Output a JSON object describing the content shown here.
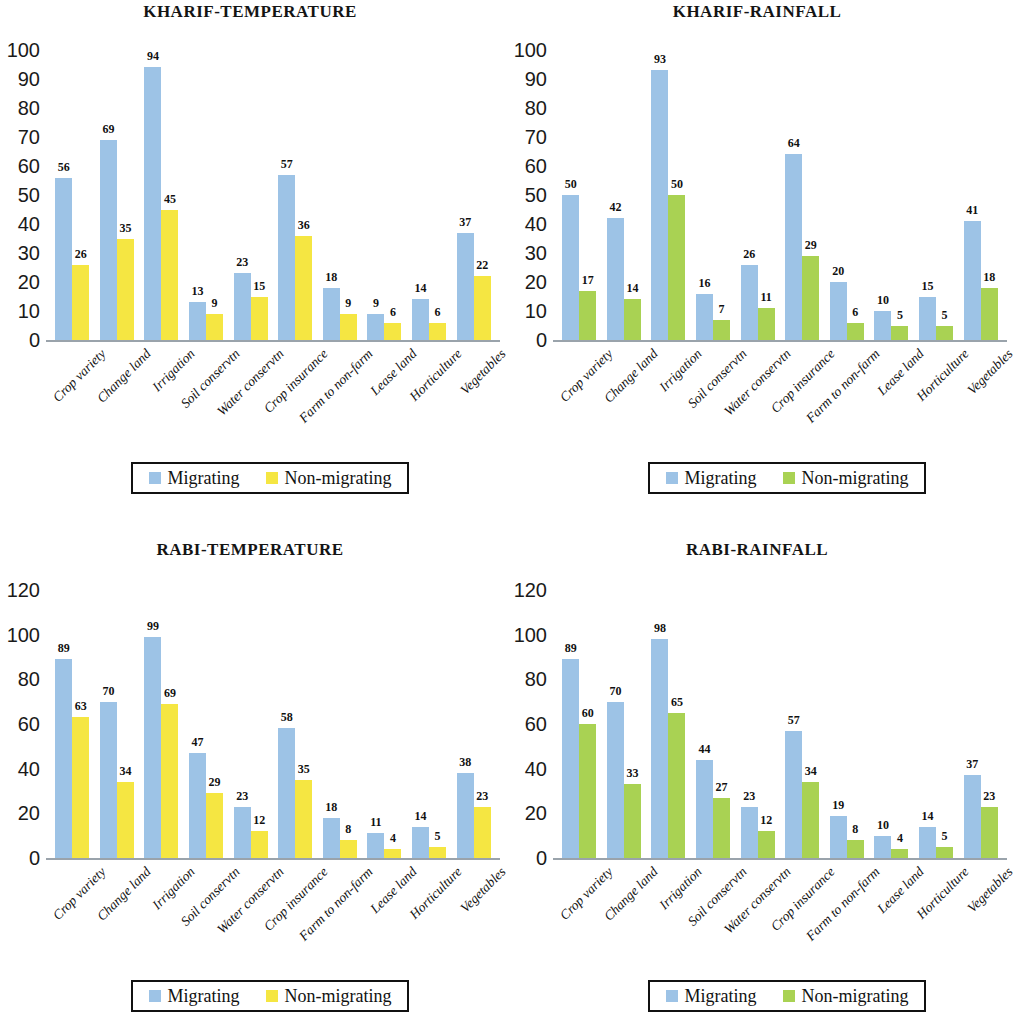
{
  "colors": {
    "migrating": "#9dc3e6",
    "non_migrating_yellow": "#f5e642",
    "non_migrating_green": "#a9d253",
    "axis": "#9aa3ab",
    "text": "#111111"
  },
  "categories": [
    "Crop variety",
    "Change land",
    "Irrigation",
    "Soil conservtn",
    "Water conservtn",
    "Crop insurance",
    "Farm to non-farm",
    "Lease land",
    "Horticulture",
    "Vegetables"
  ],
  "legend": {
    "migrating_label": "Migrating",
    "non_migrating_label": "Non-migrating"
  },
  "chart_data": [
    {
      "id": "kharif-temperature",
      "type": "bar",
      "title": "KHARIF-TEMPERATURE",
      "xlabel": "",
      "ylabel": "",
      "ylim": [
        0,
        100
      ],
      "yticks": [
        0,
        10,
        20,
        30,
        40,
        50,
        60,
        70,
        80,
        90,
        100
      ],
      "ytick_labels": [
        "0",
        "10",
        "20",
        "30",
        "40",
        "50",
        "60",
        "70",
        "80",
        "90",
        "100"
      ],
      "grid": false,
      "legend_position": "bottom-center",
      "categories": [
        "Crop variety",
        "Change land",
        "Irrigation",
        "Soil conservtn",
        "Water conservtn",
        "Crop insurance",
        "Farm to non-farm",
        "Lease land",
        "Horticulture",
        "Vegetables"
      ],
      "series": [
        {
          "name": "Migrating",
          "color": "#9dc3e6",
          "values": [
            56,
            69,
            94,
            13,
            23,
            57,
            18,
            9,
            14,
            37
          ]
        },
        {
          "name": "Non-migrating",
          "color": "#f5e642",
          "values": [
            26,
            35,
            45,
            9,
            15,
            36,
            9,
            6,
            6,
            22
          ]
        }
      ]
    },
    {
      "id": "kharif-rainfall",
      "type": "bar",
      "title": "KHARIF-RAINFALL",
      "xlabel": "",
      "ylabel": "",
      "ylim": [
        0,
        100
      ],
      "yticks": [
        0,
        10,
        20,
        30,
        40,
        50,
        60,
        70,
        80,
        90,
        100
      ],
      "ytick_labels": [
        "0",
        "10",
        "20",
        "30",
        "40",
        "50",
        "60",
        "70",
        "80",
        "90",
        "100"
      ],
      "grid": false,
      "legend_position": "bottom-center",
      "categories": [
        "Crop variety",
        "Change land",
        "Irrigation",
        "Soil conservtn",
        "Water conservtn",
        "Crop insurance",
        "Farm to non-farm",
        "Lease land",
        "Horticulture",
        "Vegetables"
      ],
      "series": [
        {
          "name": "Migrating",
          "color": "#9dc3e6",
          "values": [
            50,
            42,
            93,
            16,
            26,
            64,
            20,
            10,
            15,
            41
          ]
        },
        {
          "name": "Non-migrating",
          "color": "#a9d253",
          "values": [
            17,
            14,
            50,
            7,
            11,
            29,
            6,
            5,
            5,
            18
          ]
        }
      ]
    },
    {
      "id": "rabi-temperature",
      "type": "bar",
      "title": "RABI-TEMPERATURE",
      "xlabel": "",
      "ylabel": "",
      "ylim": [
        0,
        120
      ],
      "yticks": [
        0,
        20,
        40,
        60,
        80,
        100,
        120
      ],
      "ytick_labels": [
        "0",
        "20",
        "40",
        "60",
        "80",
        "100",
        "120"
      ],
      "grid": false,
      "legend_position": "bottom-center",
      "categories": [
        "Crop variety",
        "Change land",
        "Irrigation",
        "Soil conservtn",
        "Water conservtn",
        "Crop insurance",
        "Farm to non-farm",
        "Lease land",
        "Horticulture",
        "Vegetables"
      ],
      "series": [
        {
          "name": "Migrating",
          "color": "#9dc3e6",
          "values": [
            89,
            70,
            99,
            47,
            23,
            58,
            18,
            11,
            14,
            38
          ]
        },
        {
          "name": "Non-migrating",
          "color": "#f5e642",
          "values": [
            63,
            34,
            69,
            29,
            12,
            35,
            8,
            4,
            5,
            23
          ]
        }
      ]
    },
    {
      "id": "rabi-rainfall",
      "type": "bar",
      "title": "RABI-RAINFALL",
      "xlabel": "",
      "ylabel": "",
      "ylim": [
        0,
        120
      ],
      "yticks": [
        0,
        20,
        40,
        60,
        80,
        100,
        120
      ],
      "ytick_labels": [
        "0",
        "20",
        "40",
        "60",
        "80",
        "100",
        "120"
      ],
      "grid": false,
      "legend_position": "bottom-center",
      "categories": [
        "Crop variety",
        "Change land",
        "Irrigation",
        "Soil conservtn",
        "Water conservtn",
        "Crop insurance",
        "Farm to non-farm",
        "Lease land",
        "Horticulture",
        "Vegetables"
      ],
      "series": [
        {
          "name": "Migrating",
          "color": "#9dc3e6",
          "values": [
            89,
            70,
            98,
            44,
            23,
            57,
            19,
            10,
            14,
            37
          ]
        },
        {
          "name": "Non-migrating",
          "color": "#a9d253",
          "values": [
            60,
            33,
            65,
            27,
            12,
            34,
            8,
            4,
            5,
            23
          ]
        }
      ]
    }
  ]
}
